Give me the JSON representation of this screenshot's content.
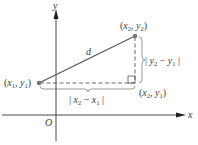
{
  "diagram": {
    "axes": {
      "x_label": "x",
      "y_label": "y",
      "origin_label": "O"
    },
    "points": {
      "p1": {
        "x": "x",
        "x_sub": "1",
        "y": "y",
        "y_sub": "1",
        "sep": ", "
      },
      "p2": {
        "x": "x",
        "x_sub": "2",
        "y": "y",
        "y_sub": "2",
        "sep": ", "
      },
      "corner": {
        "x": "x",
        "x_sub": "2",
        "y": "y",
        "y_sub": "1",
        "sep": ", "
      }
    },
    "segment_label": "d",
    "horizontal_length": {
      "bar": "|",
      "a": "x",
      "a_sub": "2",
      "minus": " − ",
      "b": "x",
      "b_sub": "1"
    },
    "vertical_length": {
      "bar": "|",
      "a": "y",
      "a_sub": "2",
      "minus": " − ",
      "b": "y",
      "b_sub": "1"
    },
    "colors": {
      "axis": "#333333",
      "segment": "#555555",
      "dashed": "#444444",
      "point": "#777777",
      "text": "#3a3a3a"
    }
  }
}
